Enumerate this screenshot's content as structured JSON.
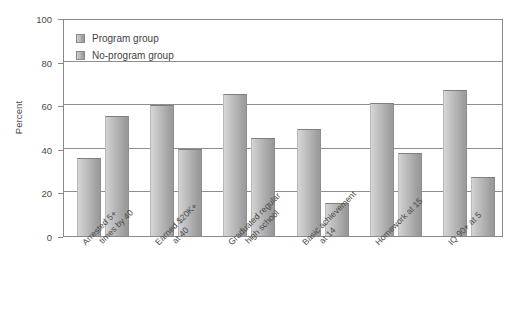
{
  "chart_data": {
    "type": "bar",
    "title": "",
    "subtitle": "",
    "xlabel": "",
    "ylabel": "Percent",
    "ylim": [
      0,
      100
    ],
    "yticks": [
      0,
      20,
      40,
      60,
      80,
      100
    ],
    "grid": true,
    "legend_position": "top-left",
    "categories": [
      "Arrested 5+ times by 40",
      "Earned $20K+ at 40",
      "Graduated regular high school",
      "Basic achievement at 14",
      "Homework at 15",
      "IQ 90+ at 5"
    ],
    "category_lines": [
      [
        "Arrested 5+",
        "times by 40"
      ],
      [
        "Earned $20K+",
        "at 40"
      ],
      [
        "Graduated regular",
        "high school"
      ],
      [
        "Basic achievement",
        "at 14"
      ],
      [
        "Homework at 15",
        ""
      ],
      [
        "IQ 90+ at 5",
        ""
      ]
    ],
    "series": [
      {
        "name": "Program group",
        "color": "#b4b4b4",
        "values": [
          36,
          60,
          65,
          49,
          61,
          67
        ]
      },
      {
        "name": "No-program group",
        "color": "#aaaaaa",
        "values": [
          55,
          40,
          45,
          15,
          38,
          27
        ]
      }
    ]
  },
  "legend": {
    "items": [
      {
        "label": "Program group"
      },
      {
        "label": "No-program group"
      }
    ]
  },
  "axis": {
    "y_title": "Percent",
    "y_ticks": [
      "100",
      "80",
      "60",
      "40",
      "20",
      "0"
    ]
  }
}
